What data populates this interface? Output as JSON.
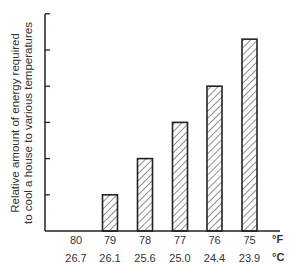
{
  "chart_data": {
    "type": "bar",
    "title": "",
    "ylabel": "Relative amount of energy required to cool a house to various temperatures",
    "ylabel_lines": [
      "Relative amount of energy required",
      "to cool a house to various temperatures"
    ],
    "xlabel": "",
    "x_unit_row1": "°F",
    "x_unit_row2": "°C",
    "categories": [
      "80",
      "79",
      "78",
      "77",
      "76",
      "75"
    ],
    "categories_celsius": [
      "26.7",
      "26.1",
      "25.6",
      "25.0",
      "24.4",
      "23.9"
    ],
    "values": [
      0,
      1,
      2,
      3,
      4,
      5.3
    ],
    "ylim": [
      0,
      6
    ],
    "y_ticks": [
      0,
      1,
      2,
      3,
      4,
      5,
      6
    ],
    "y_tick_labels_shown": false,
    "grid": false,
    "bar_fill": "diagonal-hatch",
    "bar_color": "#222222"
  }
}
